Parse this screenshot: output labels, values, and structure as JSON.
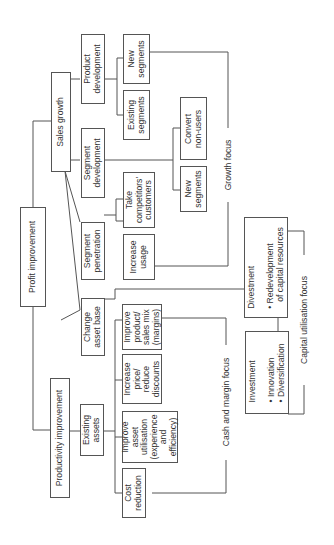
{
  "diagram": {
    "root": "Profit improvement",
    "level1": {
      "sales_growth": "Sales growth",
      "productivity": "Productivity improvement"
    },
    "strategies": {
      "product_development": "Product\ndevelopment",
      "segment_development": "Segment\ndevelopment",
      "segment_penetration": "Segment\npenetration",
      "change_asset_base": "Change\nasset base",
      "existing_assets": "Existing\nassets"
    },
    "actions": {
      "new_segments_pd": "New\nsegments",
      "existing_segments": "Existing\nsegments",
      "convert_non_users": "Convert\nnon-users",
      "new_segments_sd": "New\nsegments",
      "take_competitors": "Take\ncompetitors'\ncustomers",
      "increase_usage": "Increase\nusage",
      "improve_product_mix": "Improve\nproduct/\nsales mix\n(margins)",
      "increase_price": "Increase\nprice/\nreduce\ndiscounts",
      "improve_asset_utilisation": "Improve\nasset\nutilisation\n(experience\nand\nefficiency)",
      "cost_reduction": "Cost\nreduction",
      "divestment": "Divestment\n\n• Redevelopment\n   of capital resources",
      "investment": "Investment\n\n• Innovation\n• Diversification"
    },
    "focus_labels": {
      "growth": "Growth focus",
      "cash_margin": "Cash and margin focus",
      "capital_utilisation": "Capital utilisation focus"
    }
  }
}
